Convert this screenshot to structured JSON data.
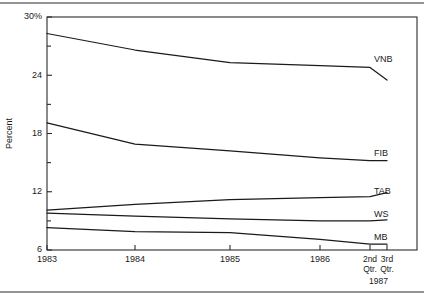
{
  "chart_data": {
    "type": "line",
    "title": "",
    "xlabel": "",
    "ylabel": "Percent",
    "ylim": [
      6,
      30
    ],
    "grid": false,
    "legend_position": "right-inline",
    "y_ticks": [
      6,
      12,
      18,
      24,
      30
    ],
    "y_tick_labels": [
      "6",
      "12",
      "18",
      "24",
      "30%"
    ],
    "y_minor_ticks": [
      9,
      15,
      21,
      27
    ],
    "x": [
      1983,
      1984,
      1985,
      1986,
      1987.25,
      1987.5
    ],
    "x_tick_labels": [
      "1983",
      "1984",
      "1985",
      "1986",
      "2nd\nQtr.",
      "3rd\nQtr."
    ],
    "x_quarter_group_label": "1987",
    "categories": [
      "1983",
      "1984",
      "1985",
      "1986",
      "2nd Qtr. 1987",
      "3rd Qtr. 1987"
    ],
    "series": [
      {
        "name": "VNB",
        "values": [
          28.3,
          26.6,
          25.3,
          25.0,
          24.8,
          23.5
        ]
      },
      {
        "name": "FIB",
        "values": [
          19.1,
          16.9,
          16.2,
          15.5,
          15.2,
          15.2
        ]
      },
      {
        "name": "TAB",
        "values": [
          10.1,
          10.7,
          11.2,
          11.4,
          11.5,
          11.9
        ]
      },
      {
        "name": "WS",
        "values": [
          9.8,
          9.5,
          9.2,
          9.0,
          9.0,
          9.1
        ]
      },
      {
        "name": "MB",
        "values": [
          8.3,
          7.9,
          7.8,
          7.1,
          6.6,
          6.6
        ]
      }
    ]
  },
  "layout": {
    "plot_left": 47,
    "plot_right": 417,
    "plot_top": 17,
    "plot_bottom": 250,
    "x_positions": [
      47,
      135,
      230,
      320,
      370,
      387
    ],
    "label_x": 374,
    "top_rule_y": 3,
    "bottom_rule_y": 292
  }
}
